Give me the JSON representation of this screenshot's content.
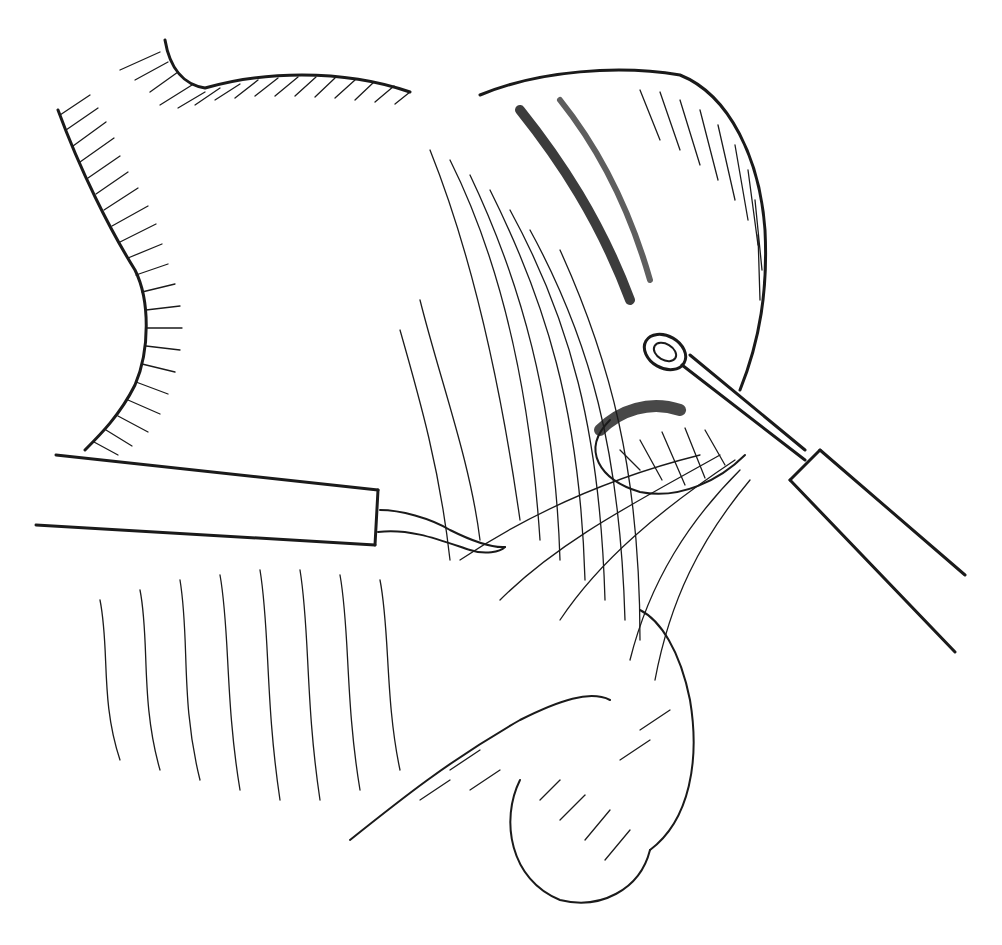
{
  "illustration": {
    "subject": "surgical line drawing",
    "colors": {
      "ink": "#1a1a1a",
      "paper": "#ffffff"
    },
    "elements": {
      "scalpel": "scalpel",
      "forceps": "ring-forceps",
      "stomach": "upper-tissue-mass",
      "loop": "dark-tissue-loop",
      "mesentery": "fanning-fibers",
      "bowel": "lower-bowel-loops"
    }
  }
}
